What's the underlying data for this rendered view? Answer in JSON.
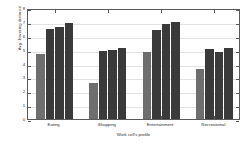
{
  "chart_data": {
    "type": "bar",
    "title": "",
    "xlabel": "Work cell's profile",
    "ylabel": "Avg. hovering distance",
    "categories": [
      "Eating",
      "Shopping",
      "Entertainment",
      "Recreational"
    ],
    "series": [
      {
        "name": "series-1",
        "color": "#6e6e6e",
        "values": [
          4.7,
          2.6,
          4.8,
          3.6
        ]
      },
      {
        "name": "series-2",
        "color": "#3a3a3a",
        "values": [
          6.5,
          4.9,
          6.4,
          5.05
        ]
      },
      {
        "name": "series-3",
        "color": "#3a3a3a",
        "values": [
          6.6,
          4.95,
          6.85,
          4.85
        ]
      },
      {
        "name": "series-4",
        "color": "#3a3a3a",
        "values": [
          6.95,
          5.1,
          7.0,
          5.15
        ]
      }
    ],
    "ylim": [
      0,
      8
    ],
    "yticks": [
      0,
      1,
      2,
      3,
      4,
      5,
      6,
      7,
      8
    ],
    "ytick_labels": [
      "0",
      "1",
      "2",
      "3",
      "4",
      "5",
      "6",
      "7",
      "8"
    ],
    "grid": true,
    "legend": "none",
    "axis_color": "#5a5a5a",
    "grid_color": "#e2e2e2",
    "background": "#ffffff"
  }
}
